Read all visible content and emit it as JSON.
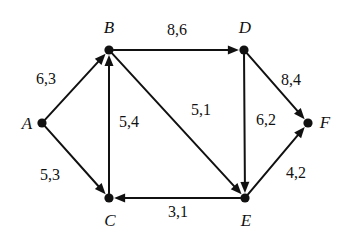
{
  "figure": {
    "type": "directed-weighted-graph",
    "background_color": "#ffffff",
    "stroke_color": "#111111",
    "width": 342,
    "height": 239
  },
  "graph_data": {
    "type": "diagram",
    "directed": true,
    "edge_label_format": "capacity,flow",
    "nodes": [
      {
        "id": "A",
        "label": "A",
        "x": 42,
        "y": 123,
        "label_x": 27,
        "label_y": 123
      },
      {
        "id": "B",
        "label": "B",
        "x": 109,
        "y": 50,
        "label_x": 109,
        "label_y": 27
      },
      {
        "id": "C",
        "label": "C",
        "x": 109,
        "y": 198,
        "label_x": 110,
        "label_y": 220
      },
      {
        "id": "D",
        "label": "D",
        "x": 244,
        "y": 50,
        "label_x": 245,
        "label_y": 27
      },
      {
        "id": "E",
        "label": "E",
        "x": 245,
        "y": 198,
        "label_x": 246,
        "label_y": 220
      },
      {
        "id": "F",
        "label": "F",
        "x": 308,
        "y": 123,
        "label_x": 325,
        "label_y": 122
      }
    ],
    "edges": [
      {
        "from": "A",
        "to": "B",
        "label": "6,3",
        "label_x": 46,
        "label_y": 79
      },
      {
        "from": "A",
        "to": "C",
        "label": "5,3",
        "label_x": 50,
        "label_y": 175
      },
      {
        "from": "C",
        "to": "B",
        "label": "5,4",
        "label_x": 129,
        "label_y": 122
      },
      {
        "from": "B",
        "to": "D",
        "label": "8,6",
        "label_x": 177,
        "label_y": 30
      },
      {
        "from": "B",
        "to": "E",
        "label": "5,1",
        "label_x": 201,
        "label_y": 110
      },
      {
        "from": "D",
        "to": "E",
        "label": "6,2",
        "label_x": 266,
        "label_y": 120
      },
      {
        "from": "D",
        "to": "F",
        "label": "8,4",
        "label_x": 291,
        "label_y": 80
      },
      {
        "from": "E",
        "to": "C",
        "label": "3,1",
        "label_x": 178,
        "label_y": 212
      },
      {
        "from": "E",
        "to": "F",
        "label": "4,2",
        "label_x": 296,
        "label_y": 173
      }
    ]
  }
}
